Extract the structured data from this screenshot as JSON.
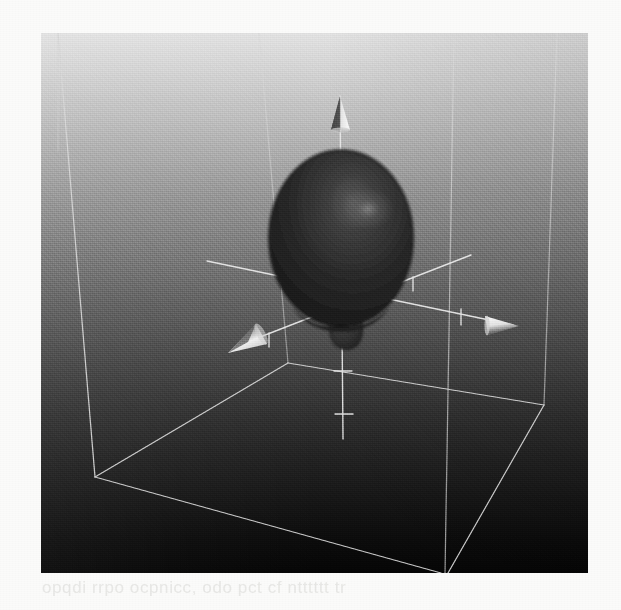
{
  "figure": {
    "caption_ghost": "ghost bleed-through text line beneath the figure",
    "render_type": "3d-isosurface",
    "background": {
      "top_color": "#e3e3e3",
      "bottom_color": "#060606",
      "gradient_direction": "vertical-light-to-dark"
    },
    "viewport": {
      "left": 41,
      "top": 33,
      "width": 547,
      "height": 540
    },
    "wireframe_box": {
      "stroke_color": "#dcdcdc",
      "stroke_width": 1.3,
      "label": "bounding box"
    },
    "axes": [
      {
        "name": "z-axis",
        "direction": "up",
        "arrowhead": "cone-up",
        "tick_count": 4,
        "stroke_color": "#e6e6e6"
      },
      {
        "name": "x-axis",
        "direction": "right",
        "arrowhead": "cone-right",
        "tick_count": 2,
        "stroke_color": "#e6e6e6"
      },
      {
        "name": "y-axis",
        "direction": "left-front",
        "arrowhead": "cone-left-front",
        "tick_count": 3,
        "stroke_color": "#e6e6e6"
      }
    ],
    "lobes": [
      {
        "name": "major-lobe",
        "shape": "ovoid",
        "center_x": 338,
        "center_y": 205,
        "radius_x": 72,
        "radius_y": 90,
        "fill_color": "#2a2a2a",
        "highlight_color": "#767676",
        "highlight_x": 358,
        "highlight_y": 178
      },
      {
        "name": "minor-lobe",
        "shape": "teardrop",
        "center_x": 338,
        "center_y": 296,
        "radius_x": 14,
        "radius_y": 21,
        "fill_color": "#303030",
        "highlight_color": "#5d5d5d"
      }
    ],
    "ghost_text": "opqdi rrpo ocpnicc, odo pct cf ntttttt   tr"
  }
}
